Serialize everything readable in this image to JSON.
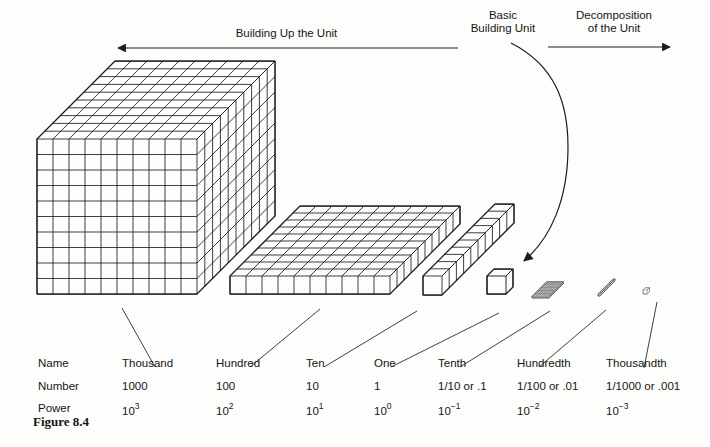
{
  "header": {
    "building_up_label": "Building Up the Unit",
    "basic_unit_line1": "Basic",
    "basic_unit_line2": "Building Unit",
    "decomposition_line1": "Decomposition",
    "decomposition_line2": "of the Unit"
  },
  "table": {
    "row_headers": [
      "Name",
      "Number",
      "Power"
    ],
    "columns": [
      {
        "name": "Thousand",
        "number": "1000",
        "power_base": "10",
        "power_exp": "3"
      },
      {
        "name": "Hundred",
        "number": "100",
        "power_base": "10",
        "power_exp": "2"
      },
      {
        "name": "Ten",
        "number": "10",
        "power_base": "10",
        "power_exp": "1"
      },
      {
        "name": "One",
        "number": "1",
        "power_base": "10",
        "power_exp": "0"
      },
      {
        "name": "Tenth",
        "number": "1/10 or .1",
        "power_base": "10",
        "power_exp": "−1"
      },
      {
        "name": "Hundredth",
        "number": "1/100 or .01",
        "power_base": "10",
        "power_exp": "−2"
      },
      {
        "name": "Thousandth",
        "number": "1/1000 or .001",
        "power_base": "10",
        "power_exp": "−3"
      }
    ]
  },
  "caption": {
    "text": "Figure 8.4"
  },
  "blocks": [
    {
      "name": "thousand-cube-block"
    },
    {
      "name": "hundred-flat-block"
    },
    {
      "name": "ten-rod-block"
    },
    {
      "name": "one-cube-block"
    },
    {
      "name": "tenth-flat-block"
    },
    {
      "name": "hundredth-rod-block"
    },
    {
      "name": "thousandth-cube-block"
    }
  ],
  "colors": {
    "ink": "#1c1c1c",
    "paper": "#fdfdfb"
  }
}
